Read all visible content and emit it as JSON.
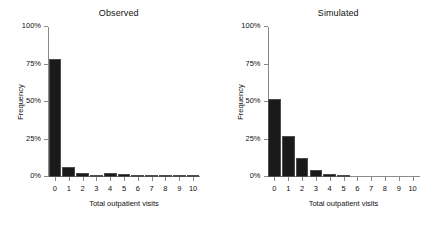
{
  "chart_data": [
    {
      "type": "bar",
      "title": "Observed",
      "xlabel": "Total outpatient visits",
      "ylabel": "Frequency",
      "categories": [
        "0",
        "1",
        "2",
        "3",
        "4",
        "5",
        "6",
        "7",
        "8",
        "9",
        "10"
      ],
      "values": [
        79,
        6.5,
        3,
        1.5,
        3,
        2,
        1.2,
        1,
        0.8,
        0.6,
        0.4
      ],
      "ytick_labels": [
        "0%",
        "25%",
        "50%",
        "75%",
        "100%"
      ],
      "ytick_values": [
        0,
        25,
        50,
        75,
        100
      ],
      "ylim": [
        0,
        100
      ],
      "xlim": [
        -0.5,
        10.5
      ],
      "grid": false,
      "legend": false,
      "bar_color": "#1a1a1a"
    },
    {
      "type": "bar",
      "title": "Simulated",
      "xlabel": "Total outpatient visits",
      "ylabel": "Frequency",
      "categories": [
        "0",
        "1",
        "2",
        "3",
        "4",
        "5",
        "6",
        "7",
        "8",
        "9",
        "10"
      ],
      "values": [
        52,
        27.5,
        13,
        5,
        2,
        0.5,
        0,
        0,
        0,
        0,
        0
      ],
      "ytick_labels": [
        "0%",
        "25%",
        "50%",
        "75%",
        "100%"
      ],
      "ytick_values": [
        0,
        25,
        50,
        75,
        100
      ],
      "ylim": [
        0,
        100
      ],
      "xlim": [
        -0.5,
        10.5
      ],
      "grid": false,
      "legend": false,
      "bar_color": "#1a1a1a"
    }
  ]
}
